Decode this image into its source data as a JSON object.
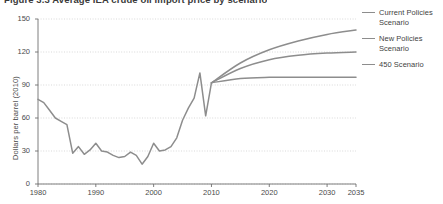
{
  "title": "Figure 3.3  Average IEA crude oil import price by scenario",
  "legend": {
    "position": "right",
    "items": [
      {
        "label": "Current Policies Scenario",
        "color": "#8d8d8d",
        "key": "current_policies"
      },
      {
        "label": "New Policies Scenario",
        "color": "#8d8d8d",
        "key": "new_policies"
      },
      {
        "label": "450 Scenario",
        "color": "#8d8d8d",
        "key": "scenario_450"
      }
    ]
  },
  "chart_data": {
    "type": "line",
    "title": "Figure 3.3  Average IEA crude oil import price by scenario",
    "xlabel": "",
    "ylabel": "Dollars per barrel (2010)",
    "xlim": [
      1980,
      2035
    ],
    "ylim": [
      0,
      150
    ],
    "grid": true,
    "xticks": [
      1980,
      1990,
      2000,
      2010,
      2020,
      2030,
      2035
    ],
    "yticks": [
      0,
      30,
      60,
      90,
      120,
      150
    ],
    "line_color": "#8d8d8d",
    "series": [
      {
        "name": "Historical",
        "key": "historical",
        "color": "#8d8d8d",
        "x": [
          1980,
          1981,
          1982,
          1983,
          1984,
          1985,
          1986,
          1987,
          1988,
          1989,
          1990,
          1991,
          1992,
          1993,
          1994,
          1995,
          1996,
          1997,
          1998,
          1999,
          2000,
          2001,
          2002,
          2003,
          2004,
          2005,
          2006,
          2007,
          2008,
          2009,
          2010
        ],
        "values": [
          77,
          74,
          67,
          60,
          57,
          54,
          28,
          34,
          27,
          31,
          37,
          30,
          29,
          26,
          24,
          25,
          29,
          26,
          18,
          25,
          37,
          30,
          31,
          34,
          42,
          58,
          69,
          78,
          101,
          62,
          92
        ]
      },
      {
        "name": "Current Policies Scenario",
        "key": "current_policies",
        "color": "#8d8d8d",
        "x": [
          2010,
          2015,
          2020,
          2025,
          2030,
          2035
        ],
        "values": [
          92,
          110,
          122,
          130,
          136,
          140
        ]
      },
      {
        "name": "New Policies Scenario",
        "key": "new_policies",
        "color": "#8d8d8d",
        "x": [
          2010,
          2015,
          2020,
          2025,
          2030,
          2035
        ],
        "values": [
          92,
          105,
          113,
          117,
          119,
          120
        ]
      },
      {
        "name": "450 Scenario",
        "key": "scenario_450",
        "color": "#8d8d8d",
        "x": [
          2010,
          2015,
          2020,
          2025,
          2030,
          2035
        ],
        "values": [
          92,
          96,
          97,
          97,
          97,
          97
        ]
      }
    ]
  },
  "axes": {
    "y_tick_labels": [
      "150",
      "120",
      "90",
      "60",
      "30",
      "0"
    ],
    "x_tick_labels": [
      "1980",
      "1990",
      "2000",
      "2010",
      "2020",
      "2030",
      "2035"
    ]
  }
}
